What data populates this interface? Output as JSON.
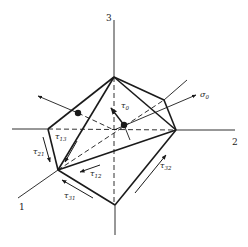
{
  "diagram": {
    "type": "octahedral stress element in principal stress coordinates",
    "colors": {
      "line": "#1a1a1a",
      "background": "#ffffff"
    },
    "axes": [
      {
        "id": "axis-1",
        "label": "1"
      },
      {
        "id": "axis-2",
        "label": "2"
      },
      {
        "id": "axis-3",
        "label": "3"
      }
    ],
    "normal_stress": {
      "symbol": "σ",
      "subscript": "0"
    },
    "octahedral_shear": {
      "symbol": "τ",
      "subscript": "0"
    },
    "shear_labels": [
      {
        "symbol": "τ",
        "subscript": "13"
      },
      {
        "symbol": "τ",
        "subscript": "21"
      },
      {
        "symbol": "τ",
        "subscript": "12"
      },
      {
        "symbol": "τ",
        "subscript": "31"
      },
      {
        "symbol": "τ",
        "subscript": "32"
      }
    ]
  }
}
